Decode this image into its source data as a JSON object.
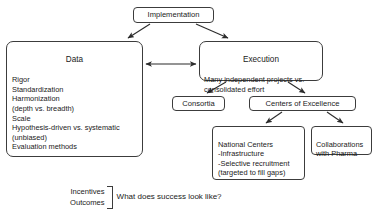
{
  "diagram": {
    "title_node": {
      "label": "Implementation"
    },
    "nodes": [
      {
        "id": "data",
        "title": "Data",
        "body": "Rigor\nStandardization\nHarmonization\n(depth vs. breadth)\nScale\nHypothesis-driven vs. systematic\n(unbiased)\nEvaluation methods"
      },
      {
        "id": "execution",
        "title": "Execution",
        "body": "Many independent projects vs.\nconsolidated effort"
      },
      {
        "id": "consortia",
        "label": "Consortia"
      },
      {
        "id": "centers-of-excellence",
        "label": "Centers of Excellence"
      },
      {
        "id": "national-centers",
        "body": "National Centers\n-Infrastructure\n-Selective recruitment\n(targeted to fill gaps)"
      },
      {
        "id": "collaborations-with-pharma",
        "body": "Collaborations\nwith Pharma"
      }
    ],
    "footer": {
      "line1": "Incentives",
      "line2": "Outcomes",
      "question": "What does success look like?"
    }
  },
  "style": {
    "stroke": "#3c3c3c",
    "text": "#1a1a1a",
    "background": "#ffffff"
  }
}
